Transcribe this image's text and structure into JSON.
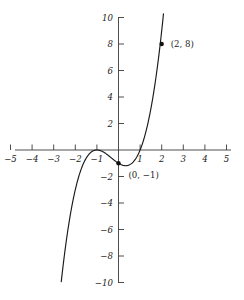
{
  "chart_data": {
    "type": "line",
    "title": "",
    "xlabel": "",
    "ylabel": "",
    "xlim": [
      -5,
      5
    ],
    "ylim": [
      -10,
      10
    ],
    "grid": false,
    "legend": null,
    "function": "y = x^3 + x^2 - x - 1",
    "x_ticks": [
      -5,
      -4,
      -3,
      -2,
      -1,
      1,
      2,
      3,
      4,
      5
    ],
    "x_tick_labels": [
      "−5",
      "−4",
      "−3",
      "−2",
      "−1",
      "1",
      "2",
      "3",
      "4",
      "5"
    ],
    "y_ticks": [
      -10,
      -8,
      -6,
      -4,
      -2,
      2,
      4,
      6,
      8,
      10
    ],
    "y_tick_labels": [
      "−10",
      "−8",
      "−6",
      "−4",
      "−2",
      "2",
      "4",
      "6",
      "8",
      "10"
    ],
    "series": [
      {
        "name": "cubic",
        "color": "#1a1a1a",
        "x": [
          -2.65,
          -2.5,
          -2.25,
          -2.0,
          -1.75,
          -1.5,
          -1.25,
          -1.0,
          -0.75,
          -0.5,
          -0.25,
          0.0,
          0.25,
          0.33,
          0.5,
          0.75,
          1.0,
          1.25,
          1.5,
          1.75,
          2.0,
          2.1
        ],
        "y": [
          -10.0,
          -7.875,
          -5.33,
          -3.0,
          -1.55,
          -0.625,
          -0.14,
          0.0,
          -0.109,
          -0.375,
          -0.703,
          -1.0,
          -1.172,
          -1.185,
          -1.125,
          -0.766,
          0.0,
          1.266,
          3.125,
          5.672,
          9.0,
          10.0
        ]
      }
    ],
    "points": [
      {
        "name": "point-2-8",
        "x": 2,
        "y": 8,
        "label": "(2, 8)",
        "label_dx": 9,
        "label_dy": 3
      },
      {
        "name": "point-0-neg1",
        "x": 0,
        "y": -1,
        "label": "(0, −1)",
        "label_dx": 10,
        "label_dy": 15
      }
    ],
    "point_labels": {
      "p0": "(2, 8)",
      "p1": "(0, −1)"
    },
    "colors": {
      "curve": "#1a1a1a",
      "axis": "#3a3a3a",
      "background": "#ffffff",
      "point": "#111111"
    }
  }
}
